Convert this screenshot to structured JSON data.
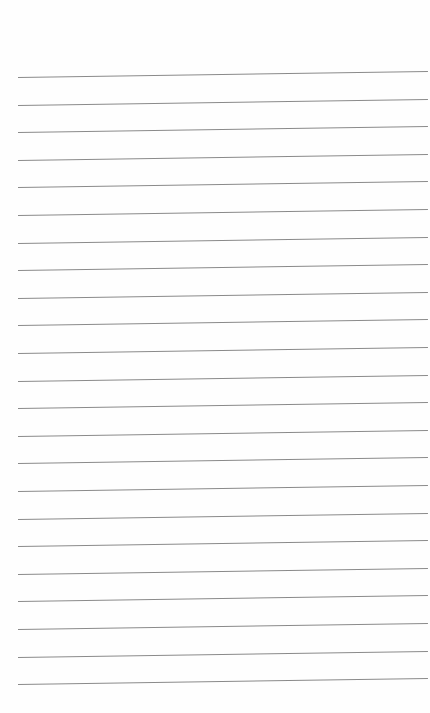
{
  "page": {
    "type": "lined-paper",
    "line_count": 23,
    "first_line_y": 77,
    "line_spacing": 27.6,
    "line_color": "#8a8a8a",
    "background": "#fefefe"
  }
}
